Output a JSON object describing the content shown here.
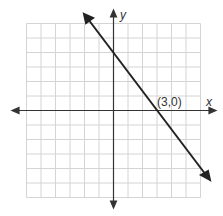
{
  "chart_data": {
    "type": "line",
    "title": "",
    "xlabel": "x",
    "ylabel": "y",
    "xlim": [
      -6,
      6
    ],
    "ylim": [
      -6,
      6
    ],
    "grid": true,
    "series": [
      {
        "name": "line",
        "equation": "y = -4/3 x + 4",
        "x": [
          -2.7,
          6.0
        ],
        "y": [
          7.6,
          -4.0
        ],
        "points": [
          [
            0,
            4
          ],
          [
            3,
            0
          ]
        ]
      }
    ],
    "annotations": [
      {
        "text": "(3,0)",
        "x": 3,
        "y": 0
      }
    ]
  },
  "labels": {
    "x_axis": "x",
    "y_axis": "y",
    "point": "(3,0)"
  }
}
